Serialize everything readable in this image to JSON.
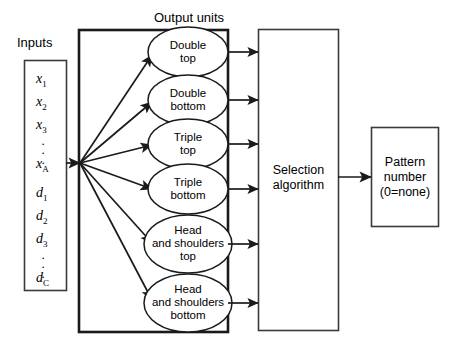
{
  "diagram": {
    "title_inputs": "Inputs",
    "title_output_units": "Output units",
    "inputs": {
      "items": [
        {
          "base": "x",
          "sub": "1"
        },
        {
          "base": "x",
          "sub": "2"
        },
        {
          "base": "x",
          "sub": "3"
        },
        {
          "base": "x",
          "sub": "A"
        },
        {
          "base": "d",
          "sub": "1"
        },
        {
          "base": "d",
          "sub": "2"
        },
        {
          "base": "d",
          "sub": "3"
        },
        {
          "base": "d",
          "sub": "C"
        }
      ],
      "ellipsis": "."
    },
    "output_units": [
      {
        "line1": "Double",
        "line2": "top",
        "line3": ""
      },
      {
        "line1": "Double",
        "line2": "bottom",
        "line3": ""
      },
      {
        "line1": "Triple",
        "line2": "top",
        "line3": ""
      },
      {
        "line1": "Triple",
        "line2": "bottom",
        "line3": ""
      },
      {
        "line1": "Head",
        "line2": "and shoulders",
        "line3": "top"
      },
      {
        "line1": "Head",
        "line2": "and shoulders",
        "line3": "bottom"
      }
    ],
    "selection_box": {
      "line1": "Selection",
      "line2": "algorithm"
    },
    "pattern_box": {
      "line1": "Pattern",
      "line2": "number",
      "line3": "(0=none)"
    },
    "colors": {
      "stroke": "#1a1a1a",
      "background": "#ffffff"
    }
  }
}
